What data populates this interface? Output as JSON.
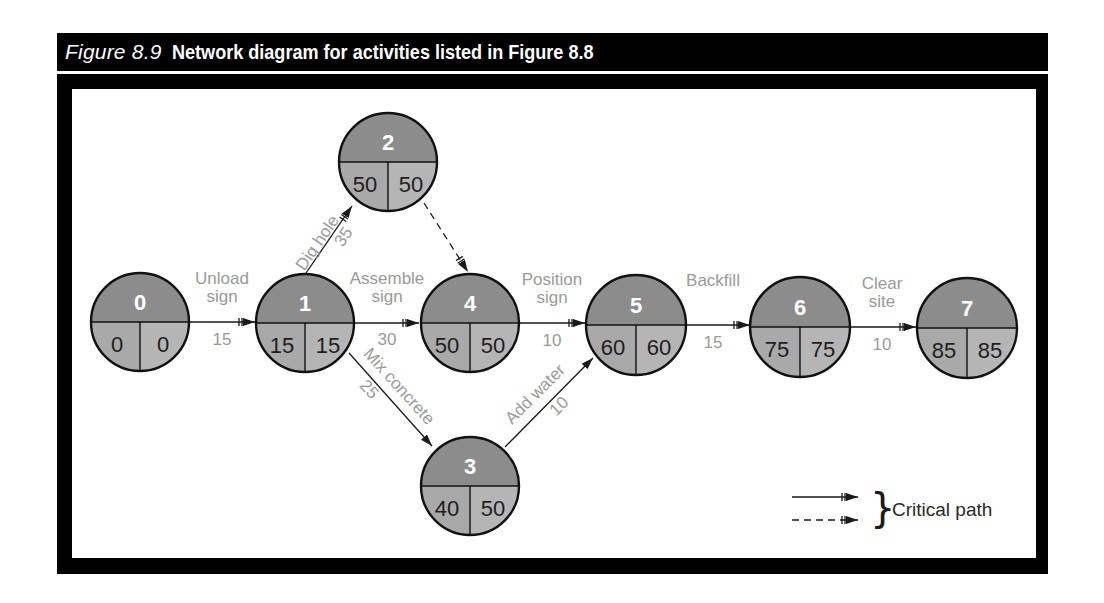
{
  "header": {
    "figure_number": "Figure 8.9",
    "title": "Network diagram for activities listed in Figure 8.8"
  },
  "colors": {
    "node_top": "#8c8c8c",
    "node_bottom_left": "#a9a9a9",
    "node_bottom_right": "#b5b5b5",
    "node_stroke": "#111111",
    "label_gray": "#9a9a9a",
    "arrow": "#1a1a1a"
  },
  "nodes": [
    {
      "id": "0",
      "es": "0",
      "ls": "0"
    },
    {
      "id": "1",
      "es": "15",
      "ls": "15"
    },
    {
      "id": "2",
      "es": "50",
      "ls": "50"
    },
    {
      "id": "3",
      "es": "40",
      "ls": "50"
    },
    {
      "id": "4",
      "es": "50",
      "ls": "50"
    },
    {
      "id": "5",
      "es": "60",
      "ls": "60"
    },
    {
      "id": "6",
      "es": "75",
      "ls": "75"
    },
    {
      "id": "7",
      "es": "85",
      "ls": "85"
    }
  ],
  "activities": [
    {
      "from": "0",
      "to": "1",
      "name_line1": "Unload",
      "name_line2": "sign",
      "duration": "15",
      "critical": true,
      "dummy": false
    },
    {
      "from": "1",
      "to": "2",
      "name": "Dig hole",
      "duration": "35",
      "critical": true,
      "dummy": false
    },
    {
      "from": "2",
      "to": "4",
      "name": "",
      "duration": "",
      "critical": true,
      "dummy": true
    },
    {
      "from": "1",
      "to": "4",
      "name_line1": "Assemble",
      "name_line2": "sign",
      "duration": "30",
      "critical": true,
      "dummy": false
    },
    {
      "from": "1",
      "to": "3",
      "name": "Mix concrete",
      "duration": "25",
      "critical": false,
      "dummy": false
    },
    {
      "from": "4",
      "to": "5",
      "name_line1": "Position",
      "name_line2": "sign",
      "duration": "10",
      "critical": true,
      "dummy": false
    },
    {
      "from": "3",
      "to": "5",
      "name": "Add water",
      "duration": "10",
      "critical": false,
      "dummy": false
    },
    {
      "from": "5",
      "to": "6",
      "name": "Backfill",
      "duration": "15",
      "critical": true,
      "dummy": false
    },
    {
      "from": "6",
      "to": "7",
      "name_line1": "Clear",
      "name_line2": "site",
      "duration": "10",
      "critical": true,
      "dummy": false
    }
  ],
  "legend": {
    "label": "Critical path",
    "items": [
      "solid-critical-arrow",
      "dashed-critical-arrow"
    ]
  }
}
